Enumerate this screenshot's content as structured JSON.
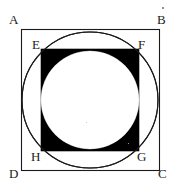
{
  "figure": {
    "background_color": "#ffffff",
    "stroke_color": "#1a1a1a",
    "fill_dark": "#000000",
    "fill_light": "#ffffff",
    "outer_square": {
      "name": "ABCD",
      "x": 21,
      "y": 29,
      "width": 138,
      "height": 141,
      "stroke_width": 1,
      "fill": "none"
    },
    "large_circle": {
      "name": "circle inscribed in ABCD",
      "cx": 90,
      "cy": 100,
      "r": 68,
      "stroke_width": 1,
      "fill": "none"
    },
    "inner_square": {
      "name": "EFGH",
      "x": 41,
      "y": 49,
      "width": 98,
      "height": 102,
      "fill": "#000000"
    },
    "small_circle": {
      "name": "circle inscribed in EFGH",
      "cx": 90,
      "cy": 100,
      "r": 49,
      "fill": "#ffffff"
    },
    "labels": [
      {
        "id": "A",
        "text": "A",
        "x": 9,
        "y": 13,
        "position": "outer-top-left"
      },
      {
        "id": "B",
        "text": "B",
        "x": 157,
        "y": 13,
        "position": "outer-top-right"
      },
      {
        "id": "C",
        "text": "C",
        "x": 158,
        "y": 167,
        "position": "outer-bottom-right"
      },
      {
        "id": "D",
        "text": "D",
        "x": 9,
        "y": 167,
        "position": "outer-bottom-left"
      },
      {
        "id": "E",
        "text": "E",
        "x": 32,
        "y": 38,
        "position": "inner-top-left"
      },
      {
        "id": "F",
        "text": "F",
        "x": 138,
        "y": 38,
        "position": "inner-top-right"
      },
      {
        "id": "G",
        "text": "G",
        "x": 137,
        "y": 150,
        "position": "inner-bottom-right"
      },
      {
        "id": "H",
        "text": "H",
        "x": 31,
        "y": 150,
        "position": "inner-bottom-left"
      }
    ]
  }
}
